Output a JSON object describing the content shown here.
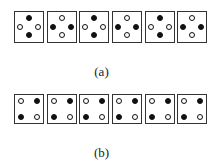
{
  "figure": {
    "panels": [
      {
        "label": "(a)",
        "layout": "cross",
        "cells": [
          {
            "top": "black",
            "left": "white",
            "right": "white",
            "bottom": "black"
          },
          {
            "top": "white",
            "left": "black",
            "right": "black",
            "bottom": "white"
          },
          {
            "top": "black",
            "left": "white",
            "right": "white",
            "bottom": "black"
          },
          {
            "top": "white",
            "left": "black",
            "right": "black",
            "bottom": "white"
          },
          {
            "top": "black",
            "left": "white",
            "right": "white",
            "bottom": "black"
          },
          {
            "top": "white",
            "left": "black",
            "right": "black",
            "bottom": "white"
          }
        ]
      },
      {
        "label": "(b)",
        "layout": "square",
        "cells": [
          {
            "tl": "white",
            "tr": "black",
            "bl": "black",
            "br": "white"
          },
          {
            "tl": "white",
            "tr": "black",
            "bl": "black",
            "br": "white"
          },
          {
            "tl": "white",
            "tr": "black",
            "bl": "black",
            "br": "white"
          },
          {
            "tl": "white",
            "tr": "black",
            "bl": "black",
            "br": "white"
          },
          {
            "tl": "white",
            "tr": "black",
            "bl": "black",
            "br": "white"
          },
          {
            "tl": "white",
            "tr": "black",
            "bl": "black",
            "br": "white"
          }
        ]
      }
    ],
    "colors": {
      "filled": "#111111",
      "hollow": "#ffffff",
      "border": "#333333"
    }
  }
}
